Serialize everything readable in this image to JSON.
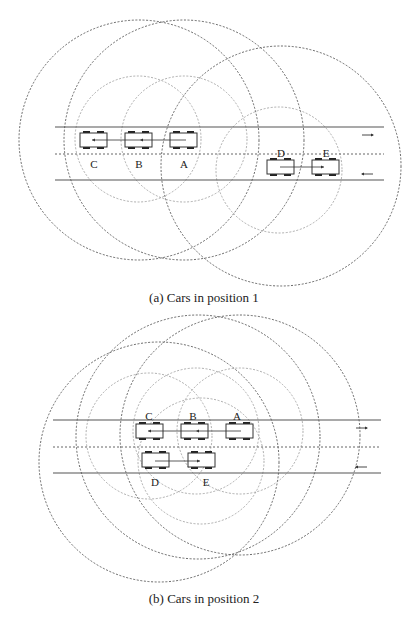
{
  "figures": [
    {
      "id": "a",
      "caption": "(a) Cars in position 1",
      "road": {
        "x1": 55,
        "x2": 384,
        "top_y": 127,
        "mid_y": 154,
        "bottom_y": 180
      },
      "lane_arrows": [
        {
          "direction": "right",
          "x": 362,
          "y": 135
        },
        {
          "direction": "left",
          "x": 362,
          "y": 174
        }
      ],
      "cars": [
        {
          "label": "C",
          "x": 80,
          "y": 133,
          "label_x": 94,
          "label_y": 164
        },
        {
          "label": "B",
          "x": 125,
          "y": 133,
          "label_x": 139,
          "label_y": 164
        },
        {
          "label": "A",
          "x": 170,
          "y": 133,
          "label_x": 184,
          "label_y": 164
        },
        {
          "label": "D",
          "x": 267,
          "y": 160,
          "label_x": 281,
          "label_y": 153
        },
        {
          "label": "E",
          "x": 312,
          "y": 160,
          "label_x": 326,
          "label_y": 153
        }
      ],
      "links": [
        {
          "from": "A",
          "to": "B",
          "x1": 186,
          "x2": 140,
          "y": 140,
          "direction": "left"
        },
        {
          "from": "B",
          "to": "C",
          "x1": 140,
          "x2": 92,
          "y": 140,
          "direction": "left"
        },
        {
          "from": "D",
          "to": "E",
          "x1": 280,
          "x2": 324,
          "y": 167,
          "direction": "right"
        }
      ],
      "large_circles": [
        {
          "cx": 139,
          "cy": 140,
          "r": 120
        },
        {
          "cx": 184,
          "cy": 140,
          "r": 120
        },
        {
          "cx": 281,
          "cy": 166,
          "r": 120
        }
      ],
      "small_circles": [
        {
          "cx": 138,
          "cy": 139,
          "r": 63
        },
        {
          "cx": 184,
          "cy": 139,
          "r": 63
        },
        {
          "cx": 279,
          "cy": 170,
          "r": 63
        }
      ]
    },
    {
      "id": "b",
      "caption": "(b) Cars in position 2",
      "road": {
        "x1": 53,
        "x2": 381,
        "top_y": 420,
        "mid_y": 447,
        "bottom_y": 473
      },
      "lane_arrows": [
        {
          "direction": "right",
          "x": 356,
          "y": 428
        },
        {
          "direction": "left",
          "x": 356,
          "y": 467
        }
      ],
      "cars": [
        {
          "label": "C",
          "x": 136,
          "y": 424,
          "label_x": 149,
          "label_y": 416
        },
        {
          "label": "B",
          "x": 181,
          "y": 424,
          "label_x": 193,
          "label_y": 416
        },
        {
          "label": "A",
          "x": 226,
          "y": 424,
          "label_x": 237,
          "label_y": 416
        },
        {
          "label": "D",
          "x": 142,
          "y": 453,
          "label_x": 155,
          "label_y": 482
        },
        {
          "label": "E",
          "x": 188,
          "y": 453,
          "label_x": 206,
          "label_y": 482
        }
      ],
      "links": [
        {
          "from": "A",
          "to": "B",
          "x1": 241,
          "x2": 196,
          "y": 431,
          "direction": "left"
        },
        {
          "from": "B",
          "to": "C",
          "x1": 196,
          "x2": 148,
          "y": 431,
          "direction": "left"
        },
        {
          "from": "D",
          "to": "E",
          "x1": 155,
          "x2": 200,
          "y": 461,
          "direction": "right"
        }
      ],
      "large_circles": [
        {
          "cx": 159,
          "cy": 462,
          "r": 120
        },
        {
          "cx": 198,
          "cy": 437,
          "r": 122
        },
        {
          "cx": 240,
          "cy": 435,
          "r": 120
        }
      ],
      "small_circles": [
        {
          "cx": 149,
          "cy": 436,
          "r": 63
        },
        {
          "cx": 196,
          "cy": 431,
          "r": 63
        },
        {
          "cx": 201,
          "cy": 461,
          "r": 63
        },
        {
          "cx": 240,
          "cy": 431,
          "r": 63
        }
      ]
    }
  ],
  "car_size": {
    "w": 27,
    "h": 14
  },
  "colors": {
    "ink": "#222222",
    "large_circle": "#444444",
    "small_circle": "#999999",
    "background": "#ffffff"
  }
}
